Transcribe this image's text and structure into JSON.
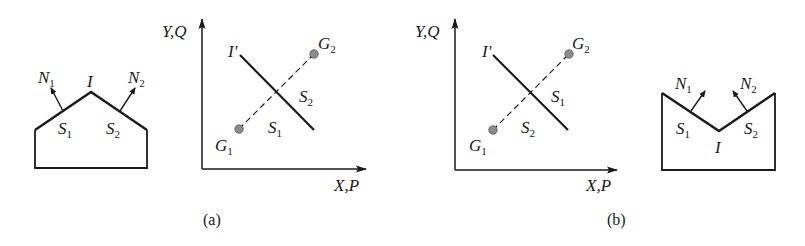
{
  "figure": {
    "panels": [
      {
        "caption": "(a)",
        "shape": {
          "type": "convex-roof",
          "vertex_label": "I",
          "normals": [
            {
              "label": "N",
              "sub": "1"
            },
            {
              "label": "N",
              "sub": "2"
            }
          ],
          "surfaces": [
            {
              "label": "S",
              "sub": "1"
            },
            {
              "label": "S",
              "sub": "2"
            }
          ]
        },
        "plot": {
          "y_axis_label": "Y,Q",
          "x_axis_label": "X,P",
          "line_label": "I'",
          "points": [
            {
              "label": "G",
              "sub": "1"
            },
            {
              "label": "G",
              "sub": "2"
            }
          ],
          "regions": [
            {
              "label": "S",
              "sub": "2",
              "position": "upper-right"
            },
            {
              "label": "S",
              "sub": "1",
              "position": "lower-left"
            }
          ]
        }
      },
      {
        "caption": "(b)",
        "plot": {
          "y_axis_label": "Y,Q",
          "x_axis_label": "X,P",
          "line_label": "I'",
          "points": [
            {
              "label": "G",
              "sub": "1"
            },
            {
              "label": "G",
              "sub": "2"
            }
          ],
          "regions": [
            {
              "label": "S",
              "sub": "1",
              "position": "upper-right"
            },
            {
              "label": "S",
              "sub": "2",
              "position": "lower-left"
            }
          ]
        },
        "shape": {
          "type": "concave-notch",
          "vertex_label": "I",
          "normals": [
            {
              "label": "N",
              "sub": "1"
            },
            {
              "label": "N",
              "sub": "2"
            }
          ],
          "surfaces": [
            {
              "label": "S",
              "sub": "1"
            },
            {
              "label": "S",
              "sub": "2"
            }
          ]
        }
      }
    ],
    "colors": {
      "stroke": "#1a1a1a",
      "point_fill": "#8c8c8c"
    }
  }
}
